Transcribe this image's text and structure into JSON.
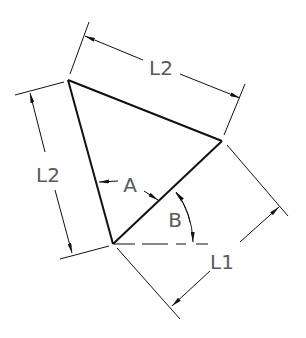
{
  "diagram": {
    "type": "technical-drawing",
    "colors": {
      "line": "#111111",
      "label": "#5a5a5a",
      "background": "#ffffff"
    },
    "labels": {
      "top_dimension": "L2",
      "left_dimension": "L2",
      "right_dimension": "L1",
      "angle_a": "A",
      "angle_b": "B"
    }
  }
}
